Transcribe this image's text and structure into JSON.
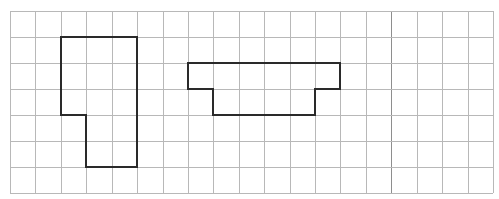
{
  "diagram": {
    "type": "grid-with-shapes",
    "grid": {
      "origin_x": 10,
      "origin_y": 11,
      "columns": 19,
      "rows": 7,
      "cell_width": 25.42,
      "cell_height": 26,
      "line_color": "#b8b8b8",
      "accent_columns": [
        15
      ],
      "accent_line_color": "#8e8e8e"
    },
    "shapes": [
      {
        "name": "shape-left-l",
        "stroke_color": "#2a2a2a",
        "vertices_grid": [
          [
            2,
            1
          ],
          [
            5,
            1
          ],
          [
            5,
            6
          ],
          [
            3,
            6
          ],
          [
            3,
            4
          ],
          [
            2,
            4
          ]
        ]
      },
      {
        "name": "shape-right-platform",
        "stroke_color": "#2a2a2a",
        "vertices_grid": [
          [
            7,
            2
          ],
          [
            13,
            2
          ],
          [
            13,
            3
          ],
          [
            12,
            3
          ],
          [
            12,
            4
          ],
          [
            8,
            4
          ],
          [
            8,
            3
          ],
          [
            7,
            3
          ]
        ]
      }
    ]
  }
}
